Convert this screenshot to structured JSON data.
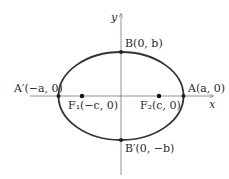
{
  "diagram": {
    "type": "ellipse",
    "colors": {
      "ellipse": "#333333",
      "axes": "#777777",
      "text": "#2a2a2a"
    },
    "axes": {
      "x_label": "x",
      "y_label": "y"
    },
    "points": {
      "B": {
        "label": "B(0, b)"
      },
      "B_prime": {
        "label": "B′(0, −b)"
      },
      "A": {
        "label": "A(a, 0)"
      },
      "A_prime": {
        "label": "A′(−a, 0)"
      },
      "F1": {
        "label": "F₁(−c, 0)"
      },
      "F2": {
        "label": "F₂(c, 0)"
      }
    }
  }
}
